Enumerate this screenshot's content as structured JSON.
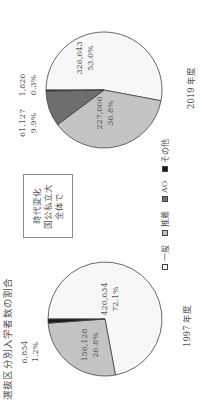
{
  "title": "選抜区分別入学者数の割合",
  "note_box": {
    "lines": [
      "時代変化",
      "国公私立大",
      "全体で"
    ]
  },
  "legend": [
    {
      "label": "一般",
      "color": "#f7f7f7"
    },
    {
      "label": "推薦",
      "color": "#c4c4c4"
    },
    {
      "label": "AO",
      "color": "#6e6e6e"
    },
    {
      "label": "その他",
      "color": "#1a1a1a"
    }
  ],
  "pies": [
    {
      "year_label": "1997 年度",
      "labels": {
        "ippan": {
          "count": "420,634",
          "pct": "72.1%"
        },
        "suisen": {
          "count": "156,128",
          "pct": "26.8%"
        },
        "sonota": {
          "count": "6,854",
          "pct": "1.2%"
        }
      }
    },
    {
      "year_label": "2019 年度",
      "labels": {
        "ippan": {
          "count": "326,643",
          "pct": "53.0%"
        },
        "suisen": {
          "count": "227,006",
          "pct": "36.8%"
        },
        "ao": {
          "count": "61,127",
          "pct": "9.9%"
        },
        "sonota": {
          "count": "1,826",
          "pct": "0.3%"
        }
      }
    }
  ],
  "chart_data": [
    {
      "type": "pie",
      "title": "選抜区分別入学者数の割合 — 1997 年度",
      "categories": [
        "一般",
        "推薦",
        "AO",
        "その他"
      ],
      "values": [
        420634,
        156128,
        0,
        6854
      ],
      "percentages": [
        72.1,
        26.8,
        0,
        1.2
      ],
      "colors": [
        "#f7f7f7",
        "#c4c4c4",
        "#6e6e6e",
        "#1a1a1a"
      ],
      "legend_position": "bottom"
    },
    {
      "type": "pie",
      "title": "選抜区分別入学者数の割合 — 2019 年度",
      "categories": [
        "一般",
        "推薦",
        "AO",
        "その他"
      ],
      "values": [
        326643,
        227006,
        61127,
        1826
      ],
      "percentages": [
        53.0,
        36.8,
        9.9,
        0.3
      ],
      "colors": [
        "#f7f7f7",
        "#c4c4c4",
        "#6e6e6e",
        "#1a1a1a"
      ],
      "legend_position": "bottom"
    }
  ]
}
